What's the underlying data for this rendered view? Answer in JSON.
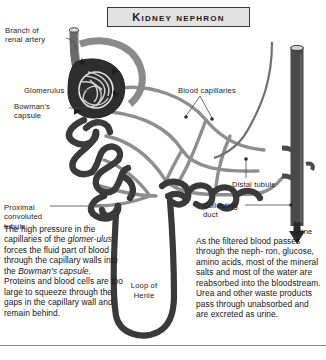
{
  "title": "Kidney nephron",
  "labels": {
    "branch_of_renal_artery": "Branch of\nrenal artery",
    "glomerulus": "Glomerulus",
    "bowmans_capsule": "Bowman's\ncapsule",
    "proximal_convoluted_tubule": "Proximal\nconvoluted\ntubule",
    "blood_capillaries": "Blood capillaries",
    "distal_tubule": "Distal tubule",
    "collecting_duct": "Collecting\nduct",
    "urine": "Urine",
    "loop_of_henle": "Loop of\nHenle"
  },
  "body_text": {
    "left": {
      "lines": [
        "The high pressure in the",
        "capillaries of the ",
        " forces the fluid part",
        "of blood through the",
        "capillary walls into the",
        ".",
        "Proteins and blood cells",
        "are too large to squeeze",
        "through the gaps in the",
        "capillary wall and remain",
        "behind."
      ],
      "italic_glomerulus_part1": "glomer-",
      "italic_glomerulus_part2": "ulus",
      "italic_bowmans": "Bowman's capsule",
      "full": "The high pressure in the capillaries of the glomerulus forces the fluid part of blood through the capillary walls into the Bowman's capsule. Proteins and blood cells are too large to squeeze through the gaps in the capillary wall and remain behind."
    },
    "right": {
      "full": "As the filtered blood passes through the nephron, glucose, amino acids, most of the mineral salts and most of the water are reabsorbed into the bloodstream. Urea and other waste products pass through unabsorbed and are excreted as urine.",
      "lines": [
        "As the filtered blood",
        "passes through the neph-",
        "ron,  glucose, amino acids,",
        "most of the mineral salts",
        "and most of the water",
        "are reabsorbed into the",
        "bloodstream. Urea and",
        "other waste products",
        "pass through unabsorbed",
        "and are excreted as urine."
      ]
    }
  },
  "colors": {
    "background": "#ffffff",
    "ink": "#1a1a1a",
    "tubule_dark": "#3a3a3a",
    "capillary_grey": "#8e8e8e",
    "capillary_fill": "#ffffff",
    "duct_dark": "#4a4a4a",
    "glomerulus_dark": "#2e2e2e",
    "title_box_fill": "#e2e2e2",
    "title_box_border": "#3a3a3a",
    "rule": "#8c8c8c"
  },
  "icons": {
    "urine_arrow": "down-arrow-icon",
    "flow_arrow": "flow-arrow-icon"
  }
}
